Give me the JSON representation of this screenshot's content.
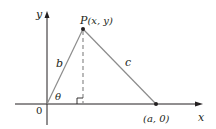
{
  "diagram": {
    "axes": {
      "x_label": "x",
      "y_label": "y",
      "origin_label": "0"
    },
    "points": {
      "P": {
        "label_name": "P",
        "label_coords": "(x, y)"
      },
      "A": {
        "label": "(a, 0)"
      }
    },
    "segments": {
      "OP": {
        "label": "b"
      },
      "PA": {
        "label": "c"
      },
      "altitude": {
        "style": "dashed"
      }
    },
    "angle": {
      "label": "θ",
      "at": "origin"
    },
    "right_angle_marker": true,
    "colors": {
      "axis": "#231f20",
      "triangle": "#8c8c8c",
      "text": "#231f20"
    }
  }
}
